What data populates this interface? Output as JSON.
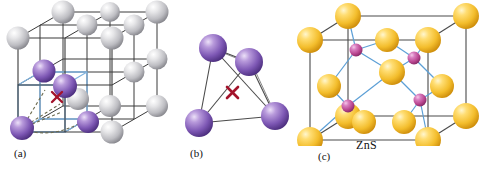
{
  "figure": {
    "background": "#ffffff",
    "width": 480,
    "height": 174
  },
  "captions": {
    "a": "(a)",
    "b": "(b)",
    "c": "(c)",
    "compound": "ZnS"
  },
  "colors": {
    "sphere_gray_light": "#f2f2f2",
    "sphere_gray_mid": "#c9c9cc",
    "sphere_gray_dark": "#8d8d92",
    "sphere_purple_light": "#cdb6e4",
    "sphere_purple_mid": "#8b68bd",
    "sphere_purple_dark": "#5a3b8c",
    "sphere_yellow_light": "#ffe9a0",
    "sphere_yellow_mid": "#f5c430",
    "sphere_yellow_dark": "#d89b10",
    "sphere_magenta_light": "#e8a8d8",
    "sphere_magenta_mid": "#c0519a",
    "sphere_magenta_dark": "#8e2f6e",
    "edge_black": "#3a3a3a",
    "edge_blue": "#7fb3e0",
    "bond_blue": "#5c9fd6",
    "marker_red": "#a3132b",
    "dashed_line": "#6b6b4f",
    "caption_text": "#111111"
  },
  "panel_a": {
    "name": "fcc-lattice-with-tetrahedral-hole",
    "description": "Face centered cubic lattice of gray spheres with purple spheres marking a tetrahedral hole",
    "cube": {
      "front_top_left": [
        18,
        38
      ],
      "front_top_right": [
        112,
        38
      ],
      "front_bottom_left": [
        18,
        132
      ],
      "front_bottom_right": [
        112,
        132
      ],
      "back_offset": [
        45,
        -26
      ]
    },
    "gray_sphere_count": 12,
    "purple_sphere_count": 4,
    "marker": {
      "symbol": "x",
      "x": 57,
      "y": 97
    },
    "sub_cube_color": "#7fb3e0",
    "dashed_bonds": 4
  },
  "panel_b": {
    "name": "tetrahedral-hole-detail",
    "description": "Four purple spheres forming a tetrahedron around a red x marking the hole",
    "spheres": [
      {
        "cx": 213,
        "cy": 48,
        "r": 14
      },
      {
        "cx": 249,
        "cy": 62,
        "r": 14
      },
      {
        "cx": 199,
        "cy": 123,
        "r": 14
      },
      {
        "cx": 275,
        "cy": 116,
        "r": 14
      }
    ],
    "marker": {
      "symbol": "x",
      "x": 232,
      "y": 92
    }
  },
  "panel_c": {
    "name": "zinc-blende-unit-cell",
    "description": "Zinc blende (ZnS) unit cell: yellow sulfide fcc lattice with purple zinc ions in half the tetrahedral holes",
    "label": "ZnS",
    "yellow_sphere_count": 14,
    "purple_sphere_count": 4,
    "cube": {
      "front_top_left": [
        310,
        40
      ],
      "front_top_right": [
        428,
        40
      ],
      "front_bottom_left": [
        310,
        140
      ],
      "front_bottom_right": [
        428,
        140
      ],
      "back_offset": [
        38,
        -24
      ]
    }
  }
}
